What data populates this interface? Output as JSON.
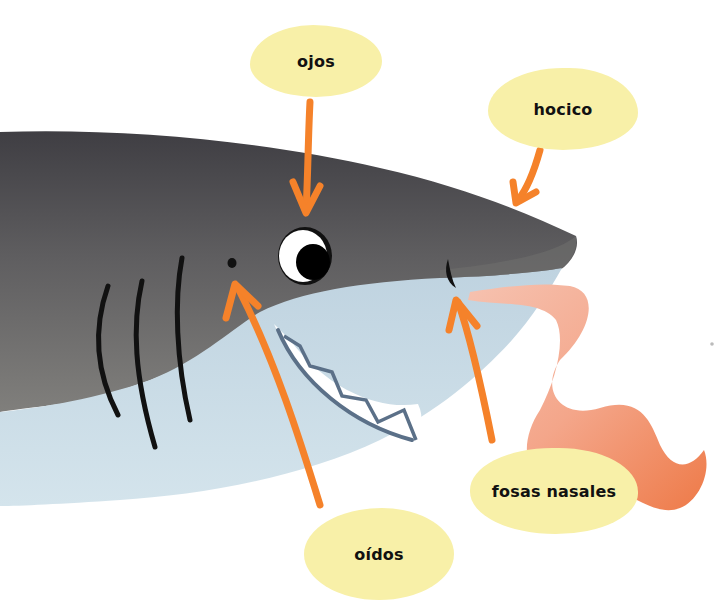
{
  "diagram": {
    "labels": {
      "eyes": "ojos",
      "snout": "hocico",
      "nostrils": "fosas nasales",
      "ears": "oídos"
    }
  },
  "colors": {
    "background": "#ffffff",
    "label_fill": "#f8f0a8",
    "label_text": "#111111",
    "arrow": "#f5822a",
    "shark_dark": "#4a4a4e",
    "shark_mid": "#7a7a78",
    "shark_belly": "#c8dbe6",
    "teeth": "#ffffff",
    "teeth_outline": "#5a6f85",
    "scent_trail_light": "#f4b8a4",
    "scent_trail_dark": "#f0824e",
    "eye_white": "#ffffff",
    "pupil": "#000000"
  }
}
